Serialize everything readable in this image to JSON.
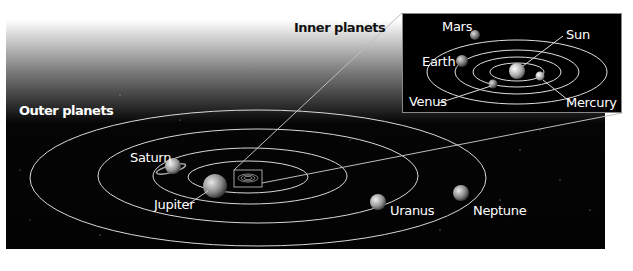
{
  "diagram": {
    "headings": {
      "outer": "Outer planets",
      "inner": "Inner planets"
    },
    "outer_planets": [
      {
        "name": "Saturn"
      },
      {
        "name": "Jupiter"
      },
      {
        "name": "Uranus"
      },
      {
        "name": "Neptune"
      }
    ],
    "inner_planets": [
      {
        "name": "Mars"
      },
      {
        "name": "Earth"
      },
      {
        "name": "Venus"
      },
      {
        "name": "Sun"
      },
      {
        "name": "Mercury"
      }
    ],
    "colors": {
      "space": "#030303",
      "orbit": "#d8d8d8",
      "label": "#ffffff",
      "heading_outer": "#ffffff",
      "heading_inner": "#111111"
    }
  }
}
